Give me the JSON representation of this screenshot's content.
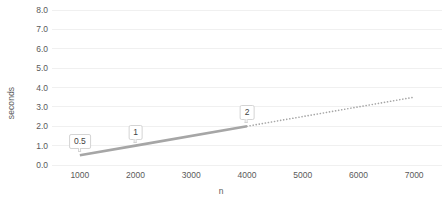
{
  "chart_data": {
    "type": "line",
    "title": "",
    "xlabel": "n",
    "ylabel": "seconds",
    "xlim": [
      500,
      7500
    ],
    "ylim": [
      0,
      8
    ],
    "grid": true,
    "legend": false,
    "x_ticks": [
      1000,
      2000,
      3000,
      4000,
      5000,
      6000,
      7000
    ],
    "x_tick_labels": [
      "1000",
      "2000",
      "3000",
      "4000",
      "5000",
      "6000",
      "7000"
    ],
    "y_ticks": [
      0,
      1,
      2,
      3,
      4,
      5,
      6,
      7,
      8
    ],
    "y_tick_labels": [
      "0.0",
      "1.0",
      "2.0",
      "3.0",
      "4.0",
      "5.0",
      "6.0",
      "7.0",
      "8.0"
    ],
    "series": [
      {
        "name": "measured",
        "style": "solid",
        "color": "#a6a6a6",
        "x": [
          1000,
          2000,
          4000
        ],
        "values": [
          0.5,
          1.0,
          2.0
        ]
      },
      {
        "name": "extrapolation",
        "style": "dotted",
        "color": "#a6a6a6",
        "x": [
          4000,
          7000
        ],
        "values": [
          2.0,
          3.5
        ]
      }
    ],
    "annotations": [
      {
        "text": "0.5",
        "x": 1000,
        "y": 0.5
      },
      {
        "text": "1",
        "x": 2000,
        "y": 1.0
      },
      {
        "text": "2",
        "x": 4000,
        "y": 2.0
      }
    ],
    "colors": {
      "line": "#a6a6a6",
      "gridline": "#f0f0f0",
      "text": "#5a5a5a",
      "label_border": "#d4d4d4",
      "background": "#ffffff"
    }
  }
}
